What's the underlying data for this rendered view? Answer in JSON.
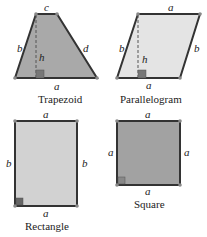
{
  "colors": {
    "outline": "#333333",
    "vertex": "#888888",
    "trapezoid_fill": "#a9a9a9",
    "parallelogram_fill": "#e4e4e4",
    "rectangle_fill": "#d2d2d2",
    "square_fill": "#a2a2a2",
    "right_angle_fill": "#666666"
  },
  "shapes": {
    "trapezoid": {
      "caption": "Trapezoid",
      "labels": {
        "top": "c",
        "left": "b",
        "right": "d",
        "bottom": "a",
        "height": "h"
      }
    },
    "parallelogram": {
      "caption": "Parallelogram",
      "labels": {
        "top": "a",
        "left": "b",
        "right": "b",
        "bottom": "a",
        "height": "h"
      }
    },
    "rectangle": {
      "caption": "Rectangle",
      "labels": {
        "top": "a",
        "left": "b",
        "right": "b",
        "bottom": "a"
      }
    },
    "square": {
      "caption": "Square",
      "labels": {
        "top": "a",
        "left": "a",
        "right": "a",
        "bottom": "a"
      }
    }
  }
}
